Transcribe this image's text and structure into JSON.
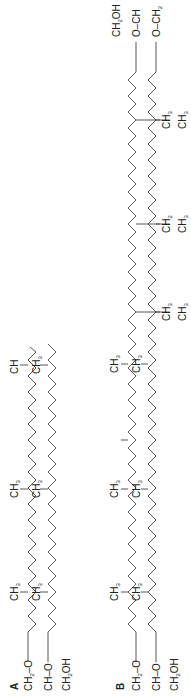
{
  "figure": {
    "panels": [
      {
        "label": "A",
        "backbone": [
          "CH2–O",
          "CH–O",
          "CH2OH"
        ],
        "chain1_methyls": [
          "CH3",
          "CH3",
          "CH3",
          "CH"
        ],
        "chain2_methyls": [
          "CH3",
          "CH3",
          "CH3",
          "CH3"
        ]
      },
      {
        "label": "B",
        "backbone_left": [
          "CH2–O",
          "CH–O",
          "CH2OH"
        ],
        "backbone_right": [
          "CH2OH",
          "O–CH",
          "O–CH2"
        ],
        "chain1_methyls": [
          "CH3",
          "CH3",
          "CH3",
          "CH3",
          "CH3",
          "CH3",
          "CH3",
          "CH3"
        ],
        "chain2_methyls": [
          "CH3",
          "CH3",
          "CH3",
          "CH3",
          "CH3",
          "CH3",
          "CH3",
          "CH3"
        ]
      }
    ],
    "text": {
      "a": "A",
      "b": "B",
      "ch2o": "CH",
      "ch": "CH",
      "o": "–O",
      "oh": "OH",
      "ch3": "CH",
      "sub2": "2",
      "sub3": "3"
    }
  }
}
